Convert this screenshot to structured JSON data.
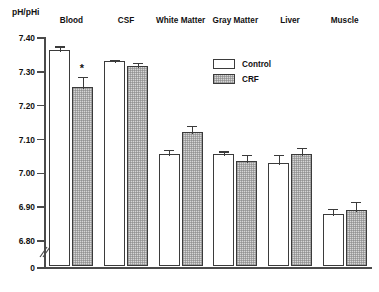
{
  "chart_data": {
    "type": "bar",
    "title": "",
    "xlabel": "",
    "ylabel": "pH/pHi",
    "categories": [
      "Blood",
      "CSF",
      "White Matter",
      "Gray Matter",
      "Liver",
      "Muscle"
    ],
    "series": [
      {
        "name": "Control",
        "color": "#ffffff",
        "values": [
          7.36,
          7.325,
          7.05,
          7.05,
          7.025,
          6.875
        ],
        "errors": [
          0.015,
          0.01,
          0.02,
          0.015,
          0.03,
          0.02
        ]
      },
      {
        "name": "CRF",
        "color": "#d6d6d6",
        "values": [
          7.25,
          7.312,
          7.115,
          7.03,
          7.05,
          6.885
        ],
        "errors": [
          0.035,
          0.015,
          0.025,
          0.025,
          0.025,
          0.03
        ]
      }
    ],
    "annotations": [
      {
        "text": "*",
        "category": "Blood",
        "series": "CRF",
        "meaning": "significant-difference"
      }
    ],
    "ytick_labels": [
      "7.40",
      "7.30",
      "7.20",
      "7.10",
      "7.00",
      "6.90",
      "6.80",
      "0"
    ],
    "ytick_values": [
      7.4,
      7.3,
      7.2,
      7.1,
      7.0,
      6.9,
      6.8,
      0
    ],
    "ylim": [
      6.75,
      7.4
    ],
    "axis_break": true,
    "grid": false,
    "legend_position": "top-center",
    "legend_entries": [
      "Control",
      "CRF"
    ]
  },
  "legend": {
    "control_label": "Control",
    "crf_label": "CRF"
  },
  "axis": {
    "y_title": "pH/pHi",
    "t0": "7.40",
    "t1": "7.30",
    "t2": "7.20",
    "t3": "7.10",
    "t4": "7.00",
    "t5": "6.90",
    "t6": "6.80",
    "t7": "0"
  },
  "categories": {
    "c0": "Blood",
    "c1": "CSF",
    "c2": "White Matter",
    "c3": "Gray Matter",
    "c4": "Liver",
    "c5": "Muscle"
  },
  "marks": {
    "star": "*"
  }
}
